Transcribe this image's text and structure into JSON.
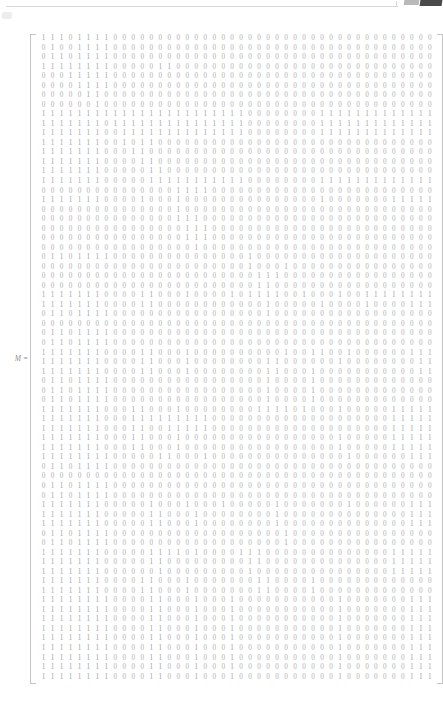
{
  "page": {
    "header": {
      "rule_present": true,
      "mark_light_color": "#b9b9b9",
      "mark_dark_color": "#4a4a4a"
    },
    "ink_color": "#a9a9a9",
    "background_color": "#ffffff"
  },
  "equation": {
    "label": "M",
    "equals": " ="
  },
  "matrix": {
    "name": "M",
    "rows": 68,
    "cols": 44,
    "bracket_style": "square",
    "values": [
      "11101111000000000000000000000000000000000000",
      "01001111000000000000000000000000000000000000",
      "01101111000000000000000000000000000000000000",
      "11111111000001100000000000000000000000000000",
      "00011111000000000000000000000000000000000000",
      "00001111000000000000000000000000000000000000",
      "00000110000000000000000000000000000000000000",
      "00000010000000000000000000000000000000000000",
      "11111111111111111111111000000001111111111111",
      "11111110111111111111111000000001111111111111",
      "11111110011111111111111000000001111111111111",
      "11111110010110000000000000000000000000000000",
      "11111110001100000000000000000000000000000000",
      "11111110000110000000000000000000000000000000",
      "11111110000011000000000000000000000000000000",
      "11111110000011111111111000000001111111111111",
      "00000000000000011110000000000000000000000000",
      "11111110000100010000000000000001000000011111",
      "00000000000000010000000000000000000000000000",
      "00000000000000011100000000000000000000000000",
      "00000000000000001110000000000000000000000000",
      "00000000000000001110000000000000000000000000",
      "00000000000000000100000000000000000000000000",
      "01101111000000000000000100000000000000000000",
      "00000000000000000000000100010000000000000000",
      "00000000000000000000000011100000000000000000",
      "00000000000000000000000011000000000000000000",
      "11111110000110001000010111100100010011111111",
      "11111110000110000000000001000001000010000111",
      "01101111000000000000000001000000000000000000",
      "00000000000000000000000000000000000000000000",
      "01101111000000000000000000000000000000000000",
      "01101111000000000000000000000000000000000000",
      "11111110000110001000000000010011001000000111",
      "11111110000110001000000001100000010000000011",
      "11111110000110001000000001100010000000000011",
      "01101111000000000000000001000010000000000000",
      "01101111000000000000000001000010000000000000",
      "01101111000000000000000001000010000000000000",
      "11111110001100010000000011110100010000011111",
      "11111110001111111110000000000000000000011111",
      "11111110001100111110000000000000000000011111",
      "11111110001100010000000000000000010000011111",
      "11111110001100010000000000000000010000011111",
      "11111111000001100010000000000000001000000111",
      "01101111000000000000000000000000000000000000",
      "00000000000000000000000000000000000000000000",
      "01101111000000000000000000000000000000000000",
      "01101111000000000000000000000000000000000000",
      "11111110000010001000100000100000001000000111",
      "11111110000011000100000000100000000000000111",
      "11111110000011000100000000100000000000000111",
      "01101111000000000000000000010000000000000000",
      "01101111000000000000000000010000000000000000",
      "11111110000011110100001110000000000000011111",
      "11111110000011000000000110000000000000011111",
      "11111110000001000000000100000000000000011111",
      "11111110000110001000000011000010000000000000",
      "11111110000110001000000011000010000000000000",
      "11111111000011000100010000000000010000000111",
      "11111111000011000100010000000000010000000111",
      "11111111000011000100010000000000010000000111",
      "11111111000011000100010000000000010000000111",
      "11111111000011000100010000000000010000000111",
      "11111111000011000100010000000000010000000111",
      "11111111000011000100010000000000010000000111",
      "11111111000011000100010000000000010000000111",
      "11111111000011000100010000000000010000000111"
    ]
  }
}
